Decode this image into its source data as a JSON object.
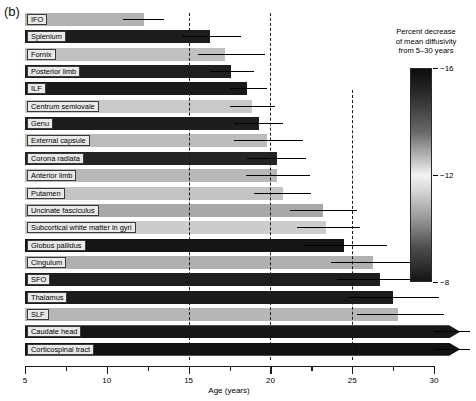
{
  "panel": {
    "letter": "(b)"
  },
  "chart_data": {
    "type": "bar",
    "title": "",
    "xlabel": "Age (years)",
    "ylabel": "",
    "xlim": [
      5,
      30
    ],
    "grid": false,
    "orientation": "horizontal",
    "legend_position": "right",
    "xticks": [
      5,
      10,
      15,
      20,
      25,
      30
    ],
    "xtick_labels": [
      "5",
      "10",
      "15",
      "20",
      "25",
      "30"
    ],
    "xminor_ticks": [
      7.5,
      12.5,
      17.5,
      22.5,
      27.5
    ],
    "reference_lines": [
      15,
      20,
      25
    ],
    "categories": [
      "IFO",
      "Splenium",
      "Fornix",
      "Posterior limb",
      "ILF",
      "Centrum semiovale",
      "Genu",
      "External capsule",
      "Corona radiata",
      "Anterior limb",
      "Putamen",
      "Uncinate fasciculus",
      "Subcortical white matter in gyri",
      "Globus pallidus",
      "Cingulum",
      "SFO",
      "Thalamus",
      "SLF",
      "Caudate head",
      "Corticospinal tract"
    ],
    "values": [
      12.3,
      16.3,
      17.2,
      17.6,
      18.6,
      18.9,
      19.3,
      19.8,
      20.4,
      20.4,
      20.8,
      23.2,
      23.4,
      24.5,
      26.3,
      26.7,
      27.5,
      27.8,
      31.6,
      31.6
    ],
    "errors_upper": [
      13.5,
      18.2,
      19.7,
      19.0,
      19.8,
      20.3,
      20.8,
      22.0,
      22.2,
      22.4,
      22.5,
      25.3,
      25.5,
      27.1,
      29.2,
      29.4,
      30.3,
      30.6,
      32.2,
      32.2
    ],
    "errors_lower": [
      11.0,
      14.6,
      15.6,
      16.3,
      17.5,
      17.5,
      17.8,
      17.8,
      18.6,
      18.5,
      19.0,
      21.2,
      21.6,
      22.0,
      23.7,
      24.1,
      24.8,
      25.3,
      30.0,
      30.0
    ],
    "truncated": [
      false,
      false,
      false,
      false,
      false,
      false,
      false,
      false,
      false,
      false,
      false,
      false,
      false,
      false,
      false,
      false,
      false,
      false,
      true,
      true
    ],
    "color_values": [
      -9.6,
      -15.2,
      -10.0,
      -15.0,
      -15.4,
      -11.1,
      -15.3,
      -10.6,
      -14.8,
      -10.4,
      -10.9,
      -11.6,
      -9.9,
      -15.6,
      -11.2,
      -15.0,
      -15.1,
      -10.8,
      -15.5,
      -15.7
    ],
    "colors": [
      "#b2b2b2",
      "#1c1c1c",
      "#c0c0c0",
      "#1f1f1f",
      "#1a1a1a",
      "#c9c9c9",
      "#1d1d1d",
      "#bcbcbc",
      "#242424",
      "#b8b8b8",
      "#c4c4c4",
      "#a8a8a8",
      "#cccccc",
      "#151515",
      "#b0b0b0",
      "#1e1e1e",
      "#1b1b1b",
      "#b6b6b6",
      "#171717",
      "#121212"
    ],
    "colorbar": {
      "title_lines": [
        "Percent decrease",
        "of mean diffusivity",
        "from 5–30 years"
      ],
      "ticks": [
        -16,
        -12,
        -8
      ],
      "tick_labels": [
        "−16",
        "−12",
        "−8"
      ],
      "range": [
        -16,
        -8
      ],
      "gradient": "dark at −16, light near −12, dark at −8"
    }
  }
}
